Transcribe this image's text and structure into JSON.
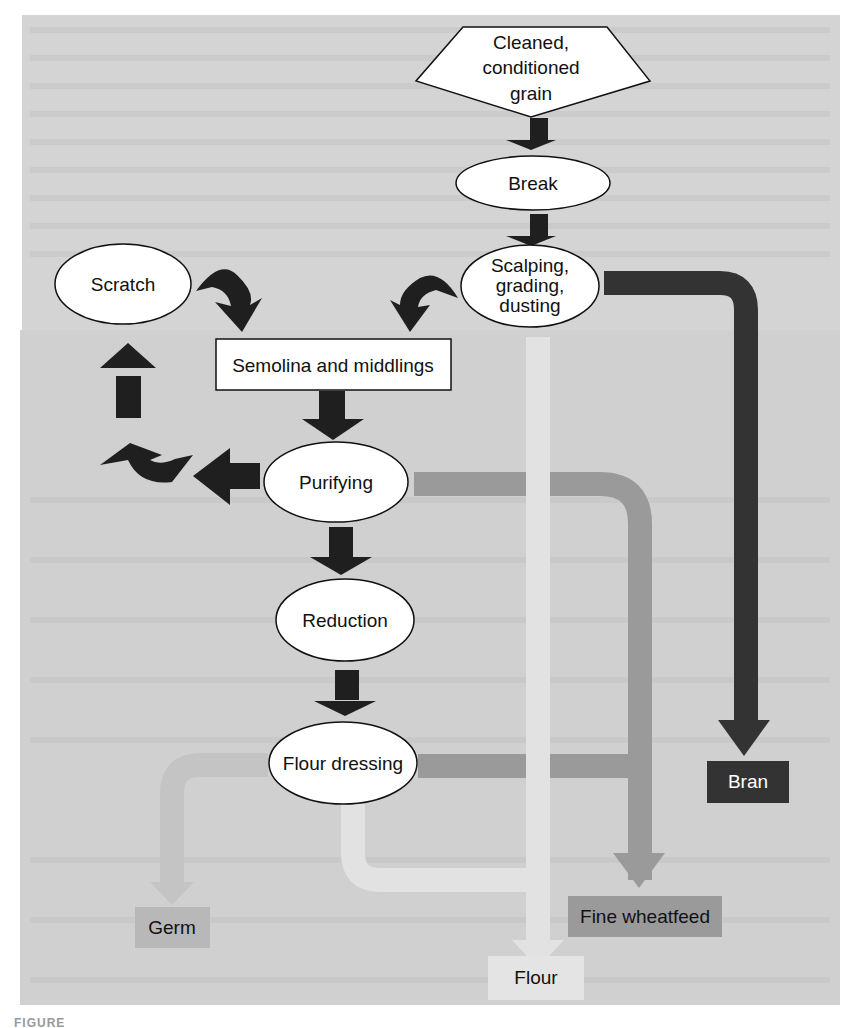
{
  "diagram": {
    "colors": {
      "background_panel": "#d2d2d2",
      "dark_arrow": "#1e1e1e",
      "bran_pipe": "#333333",
      "fine_wheatfeed_pipe": "#9a9a9a",
      "flour_pipe": "#e2e2e2",
      "germ_pipe": "#c2c2c2",
      "node_fill": "#ffffff"
    },
    "nodes": {
      "input": {
        "line1": "Cleaned,",
        "line2": "conditioned",
        "line3": "grain"
      },
      "break": "Break",
      "scalping": {
        "line1": "Scalping,",
        "line2": "grading,",
        "line3": "dusting"
      },
      "scratch": "Scratch",
      "semolina": "Semolina and middlings",
      "purifying": "Purifying",
      "reduction": "Reduction",
      "flour_dressing": "Flour dressing"
    },
    "outputs": {
      "bran": "Bran",
      "germ": "Germ",
      "fine_wheatfeed": "Fine wheatfeed",
      "flour": "Flour"
    },
    "edges": [
      {
        "from": "Cleaned, conditioned grain",
        "to": "Break"
      },
      {
        "from": "Break",
        "to": "Scalping, grading, dusting"
      },
      {
        "from": "Scalping, grading, dusting",
        "to": "Semolina and middlings"
      },
      {
        "from": "Scalping, grading, dusting",
        "to": "Bran"
      },
      {
        "from": "Scratch",
        "to": "Semolina and middlings"
      },
      {
        "from": "Semolina and middlings",
        "to": "Purifying"
      },
      {
        "from": "Purifying",
        "to": "Scratch"
      },
      {
        "from": "Purifying",
        "to": "Reduction"
      },
      {
        "from": "Purifying",
        "to": "Fine wheatfeed"
      },
      {
        "from": "Reduction",
        "to": "Flour dressing"
      },
      {
        "from": "Flour dressing",
        "to": "Germ"
      },
      {
        "from": "Flour dressing",
        "to": "Fine wheatfeed"
      },
      {
        "from": "Flour dressing",
        "to": "Flour"
      }
    ]
  },
  "caption": "FIGURE"
}
